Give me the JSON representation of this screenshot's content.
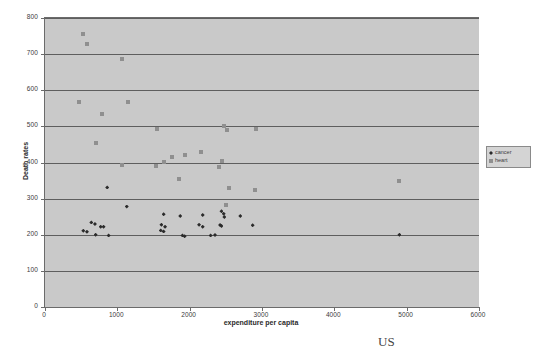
{
  "caption": "US",
  "legend": {
    "position": "right-middle",
    "entries": [
      {
        "label": "cancer",
        "marker": "diamond",
        "color": "#2b2b2b"
      },
      {
        "label": "heart",
        "marker": "square",
        "color": "#8f8f8f"
      }
    ]
  },
  "chart_data": {
    "type": "scatter",
    "title": "",
    "xlabel": "expenditure per capita",
    "ylabel": "Death rates",
    "xlim": [
      0,
      6000
    ],
    "ylim": [
      0,
      800
    ],
    "xticks": [
      0,
      1000,
      2000,
      3000,
      4000,
      5000,
      6000
    ],
    "yticks": [
      0,
      100,
      200,
      300,
      400,
      500,
      600,
      700,
      800
    ],
    "grid": "horizontal",
    "plot_background": "#c9c9c9",
    "series": [
      {
        "name": "heart",
        "marker": "square",
        "color": "#8f8f8f",
        "points": [
          [
            520,
            757
          ],
          [
            580,
            728
          ],
          [
            1060,
            686
          ],
          [
            470,
            567
          ],
          [
            1150,
            567
          ],
          [
            790,
            535
          ],
          [
            1550,
            494
          ],
          [
            2470,
            500
          ],
          [
            2920,
            494
          ],
          [
            700,
            454
          ],
          [
            2520,
            489
          ],
          [
            2160,
            428
          ],
          [
            1930,
            422
          ],
          [
            1760,
            414
          ],
          [
            1640,
            402
          ],
          [
            2450,
            403
          ],
          [
            1060,
            394
          ],
          [
            1530,
            389
          ],
          [
            2400,
            387
          ],
          [
            1850,
            355
          ],
          [
            2540,
            330
          ],
          [
            2910,
            325
          ],
          [
            2500,
            282
          ],
          [
            4900,
            348
          ]
        ]
      },
      {
        "name": "cancer",
        "marker": "diamond",
        "color": "#2b2b2b",
        "points": [
          [
            860,
            331
          ],
          [
            1130,
            278
          ],
          [
            1640,
            257
          ],
          [
            1870,
            252
          ],
          [
            2180,
            255
          ],
          [
            2440,
            265
          ],
          [
            2470,
            258
          ],
          [
            2700,
            252
          ],
          [
            2480,
            249
          ],
          [
            640,
            234
          ],
          [
            690,
            230
          ],
          [
            770,
            222
          ],
          [
            810,
            222
          ],
          [
            1610,
            228
          ],
          [
            1660,
            222
          ],
          [
            2130,
            228
          ],
          [
            2180,
            222
          ],
          [
            2420,
            227
          ],
          [
            2440,
            224
          ],
          [
            2870,
            226
          ],
          [
            530,
            211
          ],
          [
            580,
            208
          ],
          [
            700,
            200
          ],
          [
            880,
            198
          ],
          [
            1600,
            212
          ],
          [
            1640,
            209
          ],
          [
            1900,
            198
          ],
          [
            1930,
            196
          ],
          [
            2290,
            198
          ],
          [
            2350,
            199
          ],
          [
            4900,
            200
          ]
        ]
      }
    ]
  }
}
